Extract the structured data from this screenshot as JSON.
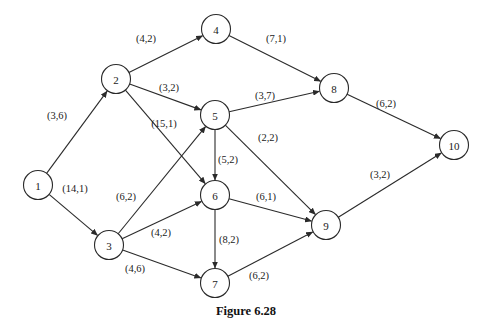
{
  "caption": "Figure 6.28",
  "nodes": [
    {
      "id": "1",
      "label": "1"
    },
    {
      "id": "2",
      "label": "2"
    },
    {
      "id": "3",
      "label": "3"
    },
    {
      "id": "4",
      "label": "4"
    },
    {
      "id": "5",
      "label": "5"
    },
    {
      "id": "6",
      "label": "6"
    },
    {
      "id": "7",
      "label": "7"
    },
    {
      "id": "8",
      "label": "8"
    },
    {
      "id": "9",
      "label": "9"
    },
    {
      "id": "10",
      "label": "10"
    }
  ],
  "edges": [
    {
      "from": "1",
      "to": "2",
      "label": "(3,6)"
    },
    {
      "from": "1",
      "to": "3",
      "label": "(14,1)"
    },
    {
      "from": "2",
      "to": "4",
      "label": "(4,2)"
    },
    {
      "from": "2",
      "to": "5",
      "label": "(3,2)"
    },
    {
      "from": "2",
      "to": "6",
      "label": "(15,1)"
    },
    {
      "from": "3",
      "to": "5",
      "label": "(6,2)"
    },
    {
      "from": "3",
      "to": "6",
      "label": "(4,2)"
    },
    {
      "from": "3",
      "to": "7",
      "label": "(4,6)"
    },
    {
      "from": "4",
      "to": "8",
      "label": "(7,1)"
    },
    {
      "from": "5",
      "to": "8",
      "label": "(3,7)"
    },
    {
      "from": "5",
      "to": "6",
      "label": "(5,2)"
    },
    {
      "from": "5",
      "to": "9",
      "label": "(2,2)"
    },
    {
      "from": "6",
      "to": "9",
      "label": "(6,1)"
    },
    {
      "from": "6",
      "to": "7",
      "label": "(8,2)"
    },
    {
      "from": "7",
      "to": "9",
      "label": "(6,2)"
    },
    {
      "from": "8",
      "to": "10",
      "label": "(6,2)"
    },
    {
      "from": "9",
      "to": "10",
      "label": "(3,2)"
    }
  ]
}
